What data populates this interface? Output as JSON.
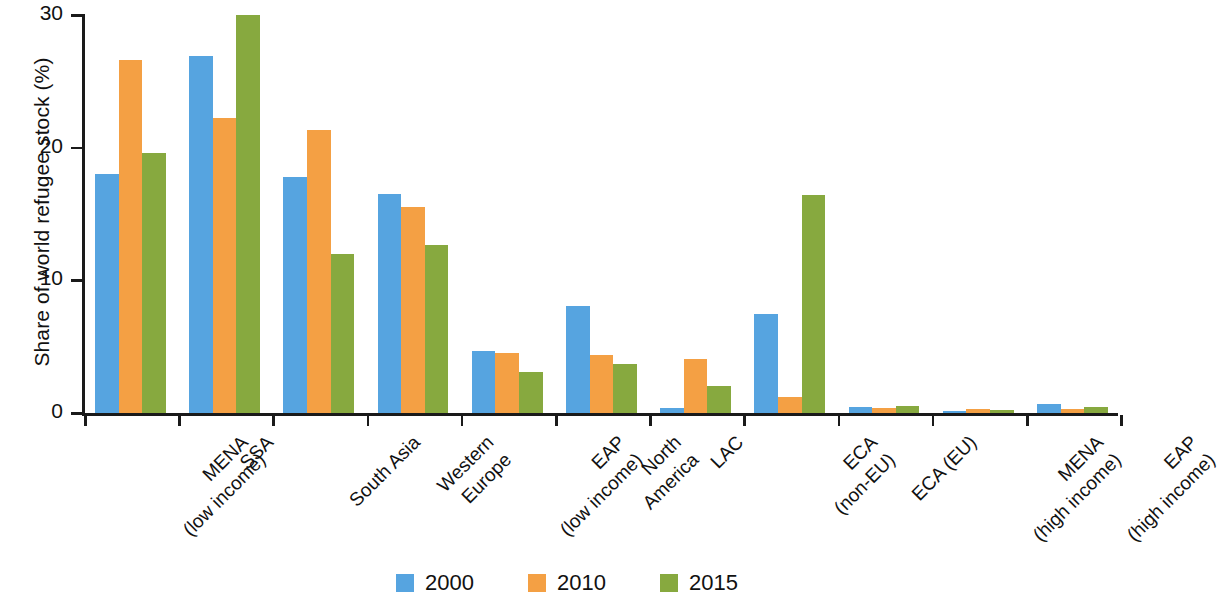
{
  "chart_data": {
    "type": "bar",
    "title": "",
    "xlabel": "",
    "ylabel": "Share of world refugee stock (%)",
    "ylim": [
      0,
      30
    ],
    "yticks": [
      0,
      10,
      20,
      30
    ],
    "grid": false,
    "legend_position": "bottom-center",
    "categories": [
      "MENA\n(low income)",
      "SSA",
      "South Asia",
      "Western\nEurope",
      "EAP\n(low income)",
      "North\nAmerica",
      "LAC",
      "ECA\n(non-EU)",
      "ECA (EU)",
      "MENA\n(high income)",
      "EAP\n(high income)"
    ],
    "category_lines": [
      [
        "MENA",
        "(low income)"
      ],
      [
        "SSA",
        ""
      ],
      [
        "South Asia",
        ""
      ],
      [
        "Western",
        "Europe"
      ],
      [
        "EAP",
        "(low income)"
      ],
      [
        "North",
        "America"
      ],
      [
        "LAC",
        ""
      ],
      [
        "ECA",
        "(non-EU)"
      ],
      [
        "ECA (EU)",
        ""
      ],
      [
        "MENA",
        "(high income)"
      ],
      [
        "EAP",
        "(high income)"
      ]
    ],
    "series": [
      {
        "name": "2000",
        "color": "#56a4e0",
        "values": [
          18.0,
          26.9,
          17.8,
          16.5,
          4.65,
          8.1,
          0.35,
          7.45,
          0.45,
          0.15,
          0.7
        ]
      },
      {
        "name": "2010",
        "color": "#f4a044",
        "values": [
          26.6,
          22.2,
          21.3,
          15.5,
          4.55,
          4.35,
          4.05,
          1.2,
          0.35,
          0.3,
          0.3
        ]
      },
      {
        "name": "2015",
        "color": "#87a93f",
        "values": [
          19.6,
          30.0,
          11.95,
          12.7,
          3.1,
          3.7,
          2.05,
          16.45,
          0.5,
          0.25,
          0.45
        ]
      }
    ]
  },
  "axis": {
    "y_title": "Share of world refugee stock (%)",
    "y_tick_labels": [
      "0",
      "10",
      "20",
      "30"
    ]
  },
  "legend": {
    "items": [
      {
        "label": "2000",
        "color": "#56a4e0"
      },
      {
        "label": "2010",
        "color": "#f4a044"
      },
      {
        "label": "2015",
        "color": "#87a93f"
      }
    ]
  }
}
